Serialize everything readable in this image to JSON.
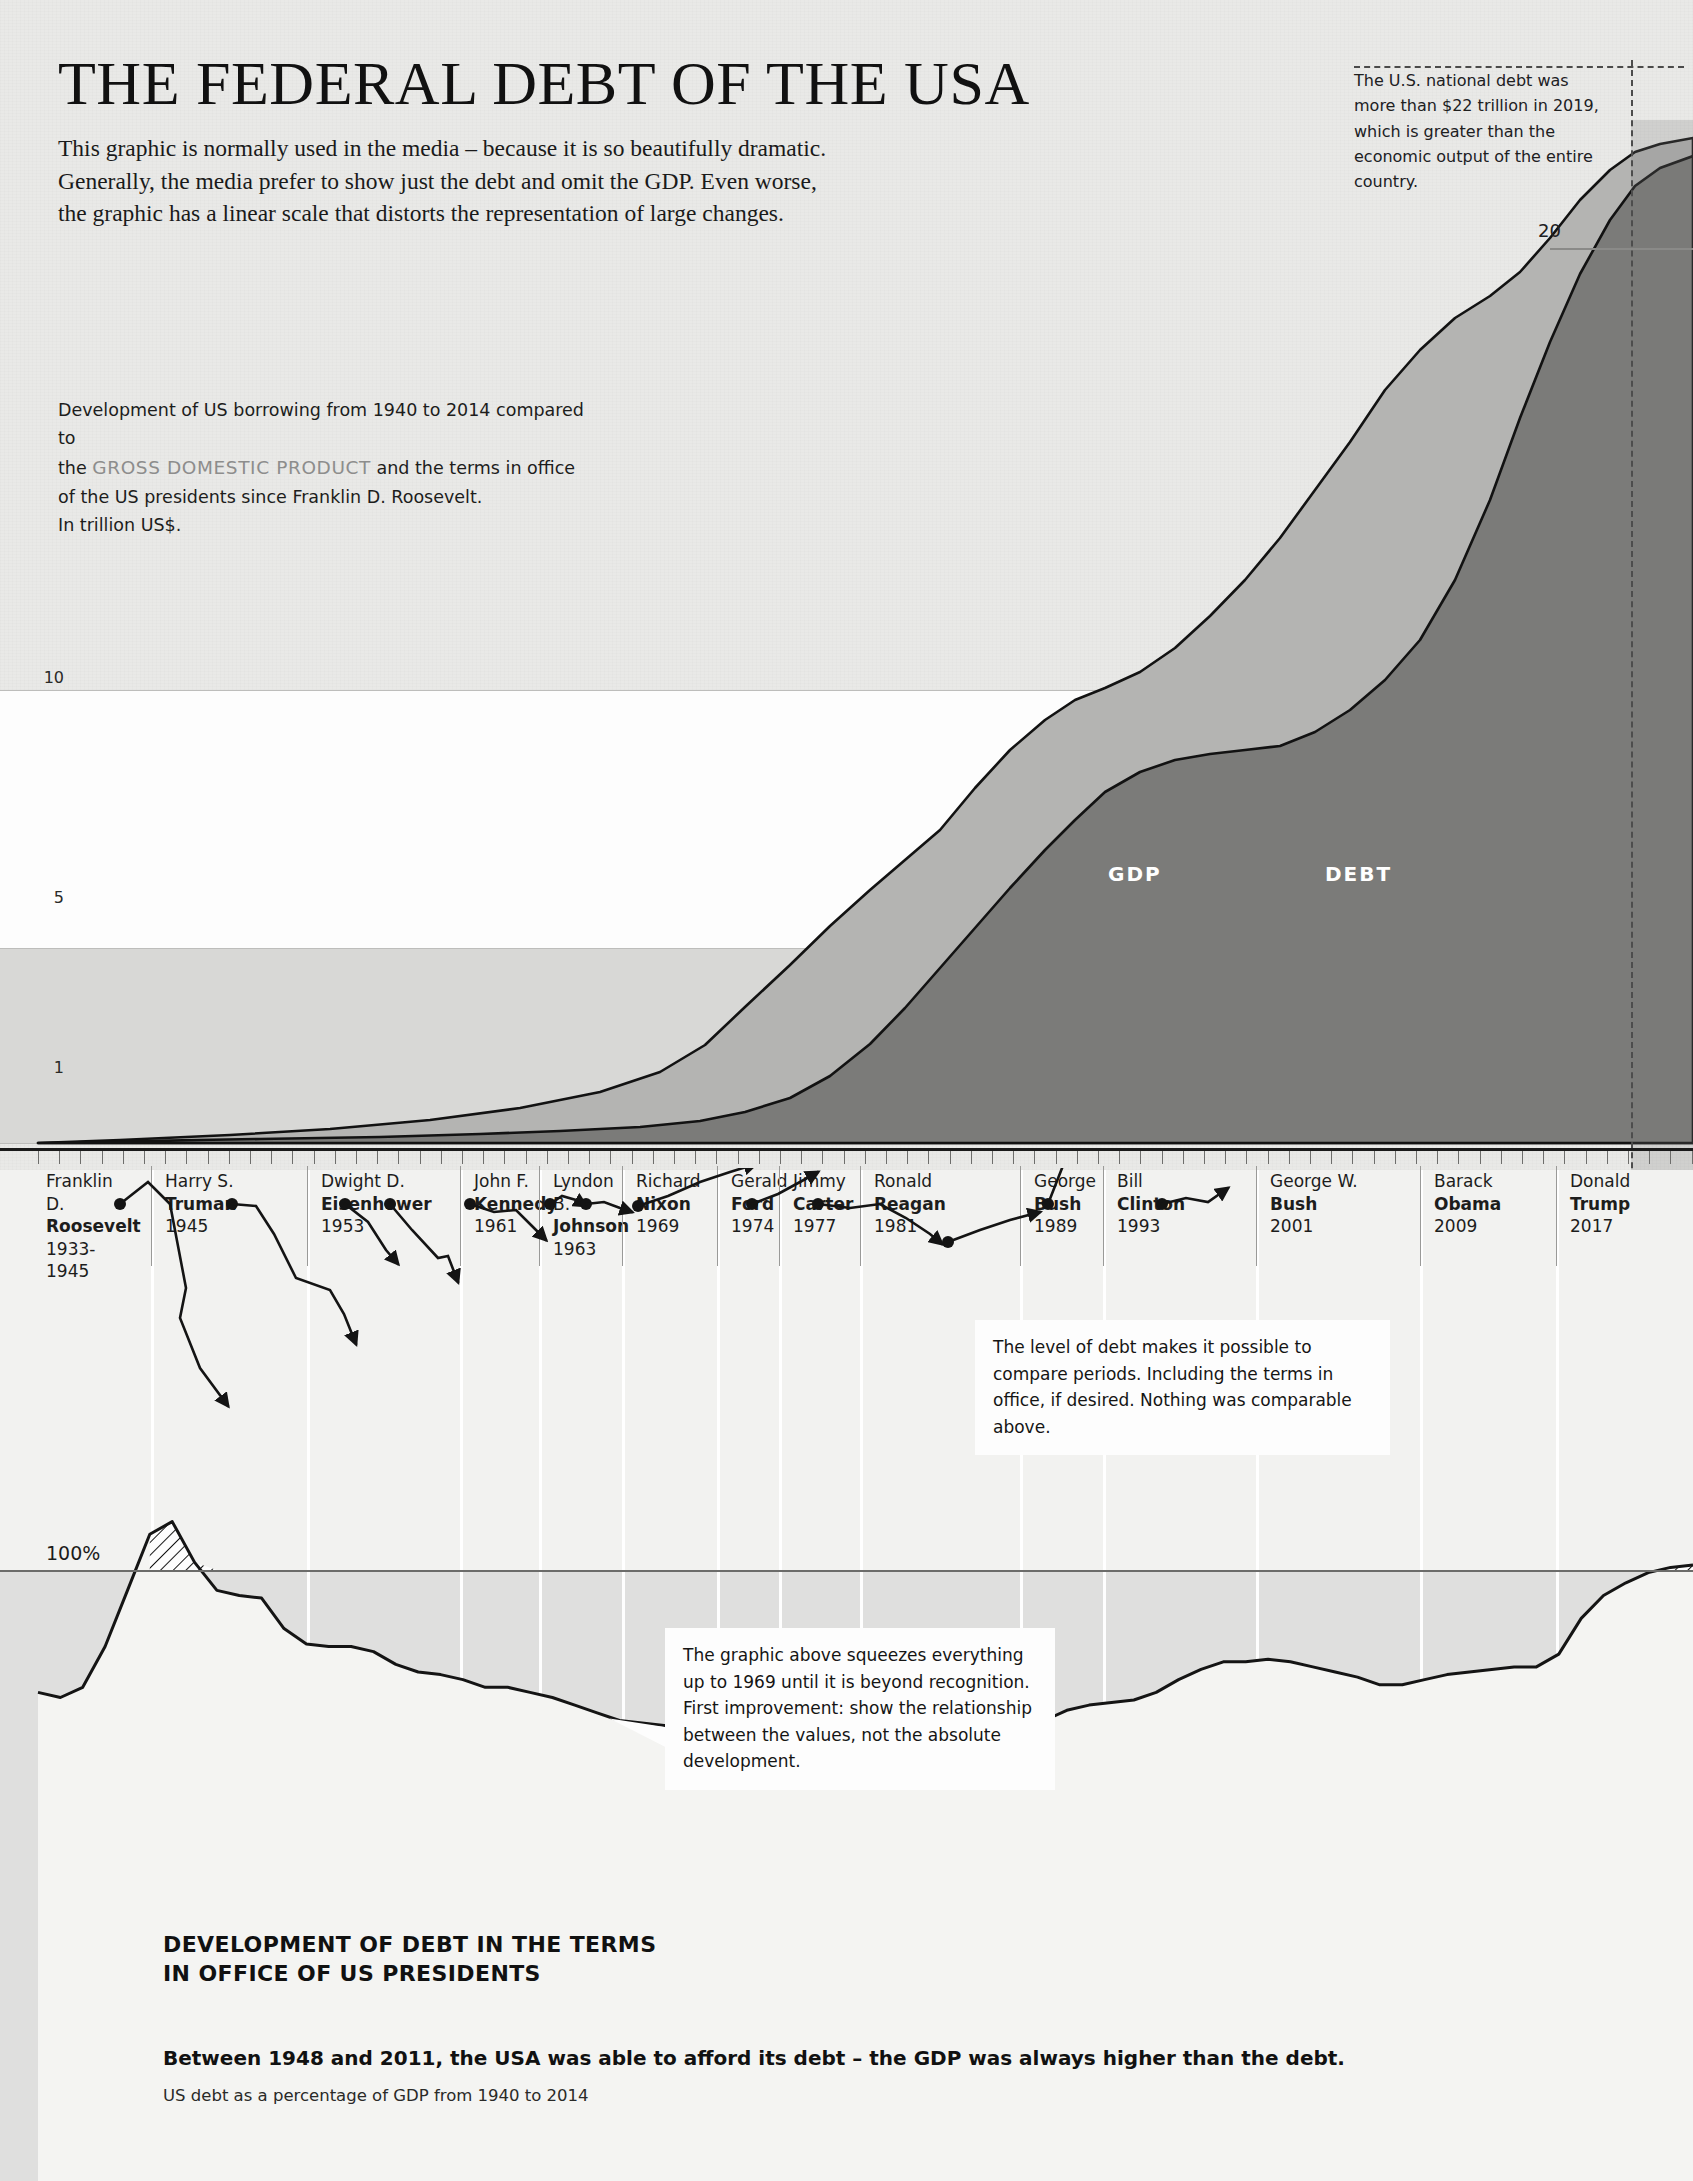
{
  "header": {
    "title": "THE FEDERAL DEBT OF THE USA",
    "subtitle_line1": "This graphic is normally used in the media – because it is so beautifully dramatic.",
    "subtitle_line2": "Generally, the media prefer to show just the debt and omit the GDP. Even worse,",
    "subtitle_line3": "the graphic has a linear scale that distorts the representation of large changes."
  },
  "top_note": {
    "text": "The U.S. national debt was more than $22 trillion in 2019, which is greater than the economic output of the entire country."
  },
  "caption": {
    "line1_a": "Development of US borrowing from 1940 to 2014 compared to",
    "line2_a": "the ",
    "line2_em": "GROSS DOMESTIC PRODUCT",
    "line2_b": " and the terms in office",
    "line3": "of the US presidents since Franklin D. Roosevelt.",
    "line4": "In trillion US$."
  },
  "upper_chart": {
    "y_labels": {
      "ten": "10",
      "five": "5",
      "one": "1",
      "twenty": "20"
    },
    "series_labels": {
      "gdp": "GDP",
      "debt": "DEBT"
    },
    "prognosis_label": "Prognosis"
  },
  "lower_chart": {
    "baseline_label": "100%"
  },
  "presidents": [
    {
      "first": "Franklin D.",
      "last": "Roosevelt",
      "year": "1933-1945",
      "x": 38,
      "w": 76
    },
    {
      "first": "Harry S.",
      "last": "Truman",
      "year": "1945",
      "x": 157,
      "w": 150
    },
    {
      "first": "Dwight D.",
      "last": "Eisenhower",
      "year": "1953",
      "x": 313,
      "w": 160
    },
    {
      "first": "John F.",
      "last": "Kennedy",
      "year": "1961",
      "x": 466,
      "w": 76
    },
    {
      "first": "Lyndon B.",
      "last": "Johnson",
      "year": "1963",
      "x": 545,
      "w": 82
    },
    {
      "first": "Richard",
      "last": "Nixon",
      "year": "1969",
      "x": 628,
      "w": 106
    },
    {
      "first": "Gerald",
      "last": "Ford",
      "year": "1974",
      "x": 723,
      "w": 62
    },
    {
      "first": "Jimmy",
      "last": "Carter",
      "year": "1977",
      "x": 785,
      "w": 80
    },
    {
      "first": "Ronald",
      "last": "Reagan",
      "year": "1981",
      "x": 866,
      "w": 160
    },
    {
      "first": "George",
      "last": "Bush",
      "year": "1989",
      "x": 1026,
      "w": 82
    },
    {
      "first": "Bill",
      "last": "Clinton",
      "year": "1993",
      "x": 1109,
      "w": 152
    },
    {
      "first": "George W.",
      "last": "Bush",
      "year": "2001",
      "x": 1262,
      "w": 162
    },
    {
      "first": "Barack",
      "last": "Obama",
      "year": "2009",
      "x": 1426,
      "w": 135
    },
    {
      "first": "Donald",
      "last": "Trump",
      "year": "2017",
      "x": 1562,
      "w": 131
    }
  ],
  "callouts": {
    "one": "The level of debt makes it possible to compare periods. Including the terms in office, if desired. Nothing was comparable above.",
    "two": "The graphic above squeezes everything up to 1969 until it is beyond recognition. First improvement: show the relationship between the values, not the absolute development."
  },
  "bottom": {
    "heading_l1": "DEVELOPMENT OF DEBT IN THE TERMS",
    "heading_l2": "IN OFFICE OF US PRESIDENTS",
    "lead": "Between 1948 and 2011, the USA was able to afford its debt – the GDP was always higher than the debt.",
    "source": "US debt as a percentage of GDP from 1940 to 2014"
  },
  "colors": {
    "paper": "#e9e9e7",
    "debt_fill": "#7b7b79",
    "gdp_fill": "#b4b4b2",
    "ink": "#111111",
    "rule": "#6c6c6a"
  },
  "chart_data": [
    {
      "type": "area",
      "id": "debt-vs-gdp-absolute",
      "title": "Development of US borrowing from 1940 to 2014 compared to the GROSS DOMESTIC PRODUCT",
      "xlabel": "",
      "ylabel": "In trillion US$",
      "ylim": [
        0,
        22
      ],
      "ytick_labels": [
        "1",
        "5",
        "10",
        "20"
      ],
      "ytick_values": [
        1,
        5,
        10,
        20
      ],
      "grid": false,
      "legend": [
        "GDP",
        "DEBT"
      ],
      "legend_position": "inline-on-areas",
      "x": [
        1940,
        1945,
        1950,
        1955,
        1960,
        1965,
        1970,
        1975,
        1980,
        1985,
        1990,
        1995,
        2000,
        2005,
        2010,
        2014,
        2017,
        2019
      ],
      "series": [
        {
          "name": "GDP",
          "values": [
            0.1,
            0.23,
            0.3,
            0.41,
            0.54,
            0.74,
            1.07,
            1.69,
            2.86,
            4.34,
            5.98,
            7.66,
            10.25,
            13.09,
            14.99,
            17.43,
            19.52,
            21.43
          ]
        },
        {
          "name": "DEBT",
          "values": [
            0.05,
            0.26,
            0.26,
            0.27,
            0.29,
            0.32,
            0.38,
            0.54,
            0.91,
            1.82,
            3.23,
            4.97,
            5.67,
            7.93,
            13.56,
            17.82,
            20.24,
            22.72
          ]
        }
      ],
      "annotations": [
        {
          "text": "The U.S. national debt was more than $22 trillion in 2019, which is greater than the economic output of the entire country.",
          "x": 2019
        },
        {
          "text": "Prognosis",
          "x": 2014,
          "type": "vertical-divider"
        }
      ]
    },
    {
      "type": "line",
      "id": "debt-as-percent-of-gdp",
      "title": "DEVELOPMENT OF DEBT IN THE TERMS IN OFFICE OF US PRESIDENTS",
      "subtitle": "Between 1948 and 2011, the USA was able to afford its debt – the GDP was always higher than the debt.",
      "source": "US debt as a percentage of GDP from 1940 to 2014",
      "xlabel": "",
      "ylabel": "%",
      "ylim": [
        0,
        130
      ],
      "ytick_labels": [
        "100%"
      ],
      "ytick_values": [
        100
      ],
      "grid": false,
      "x": [
        1940,
        1941,
        1942,
        1943,
        1944,
        1945,
        1946,
        1947,
        1948,
        1949,
        1950,
        1951,
        1952,
        1953,
        1954,
        1955,
        1956,
        1957,
        1958,
        1959,
        1960,
        1961,
        1962,
        1963,
        1964,
        1965,
        1966,
        1967,
        1968,
        1969,
        1970,
        1971,
        1972,
        1973,
        1974,
        1975,
        1976,
        1977,
        1978,
        1979,
        1980,
        1981,
        1982,
        1983,
        1984,
        1985,
        1986,
        1987,
        1988,
        1989,
        1990,
        1991,
        1992,
        1993,
        1994,
        1995,
        1996,
        1997,
        1998,
        1999,
        2000,
        2001,
        2002,
        2003,
        2004,
        2005,
        2006,
        2007,
        2008,
        2009,
        2010,
        2011,
        2012,
        2013,
        2014
      ],
      "y": [
        52,
        50,
        54,
        70,
        92,
        114,
        119,
        103,
        92,
        90,
        89,
        77,
        71,
        70,
        70,
        68,
        63,
        60,
        59,
        57,
        54,
        54,
        52,
        50,
        47,
        44,
        41,
        40,
        39,
        36,
        36,
        36,
        35,
        34,
        32,
        33,
        35,
        34,
        33,
        31,
        32,
        31,
        34,
        37,
        38,
        41,
        45,
        47,
        48,
        49,
        52,
        57,
        61,
        64,
        64,
        65,
        64,
        62,
        60,
        58,
        55,
        55,
        57,
        59,
        60,
        61,
        62,
        62,
        67,
        81,
        90,
        95,
        99,
        101,
        102
      ]
    }
  ]
}
